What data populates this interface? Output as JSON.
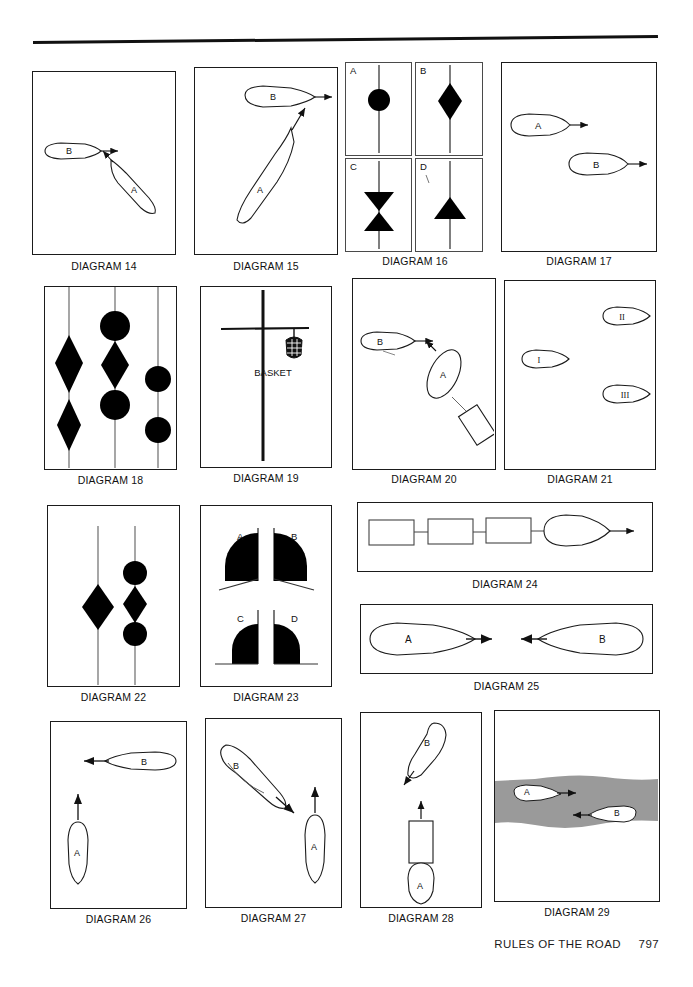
{
  "page": {
    "footer_title": "RULES OF THE ROAD",
    "footer_page_number": "797",
    "ink_color": "#1b1b1b",
    "shape_fill": "#000000",
    "channel_fill": "#9a9a9a"
  },
  "diagrams": [
    {
      "id": 14,
      "label": "DIAGRAM 14",
      "description": "Two power-driven vessels crossing: vessel B heading right, vessel A heading up-left",
      "vessels": [
        {
          "name": "B",
          "heading": "right"
        },
        {
          "name": "A",
          "heading": "up-left"
        }
      ]
    },
    {
      "id": 15,
      "label": "DIAGRAM 15",
      "description": "Vessel B heading right near top, vessel A heading up-right crossing below",
      "vessels": [
        {
          "name": "B",
          "heading": "right"
        },
        {
          "name": "A",
          "heading": "up-right"
        }
      ]
    },
    {
      "id": 16,
      "label": "DIAGRAM 16",
      "description": "Four day-shape panels on a mast",
      "panels": [
        {
          "name": "A",
          "shape": "ball"
        },
        {
          "name": "B",
          "shape": "diamond"
        },
        {
          "name": "C",
          "shape": "two-cones-points-together"
        },
        {
          "name": "D",
          "shape": "cone-point-up"
        }
      ]
    },
    {
      "id": 17,
      "label": "DIAGRAM 17",
      "description": "Vessel A above and vessel B below, both heading right",
      "vessels": [
        {
          "name": "A",
          "heading": "right"
        },
        {
          "name": "B",
          "heading": "right"
        }
      ]
    },
    {
      "id": 18,
      "label": "DIAGRAM 18",
      "description": "Three masts carrying day shapes: diamonds and balls",
      "masts": [
        {
          "shapes": [
            "diamond",
            "diamond"
          ]
        },
        {
          "shapes": [
            "ball",
            "diamond",
            "ball"
          ]
        },
        {
          "shapes": [
            "ball",
            "ball"
          ]
        }
      ]
    },
    {
      "id": 19,
      "label": "DIAGRAM 19",
      "description": "Mast with yardarm and a basket day shape hanging from it",
      "annotation": "BASKET"
    },
    {
      "id": 20,
      "label": "DIAGRAM 20",
      "description": "Vessel B heading right, vessel A towing astern heading up-left toward B",
      "vessels": [
        {
          "name": "B",
          "heading": "right"
        },
        {
          "name": "A",
          "heading": "up-left",
          "tow": "barge astern"
        }
      ]
    },
    {
      "id": 21,
      "label": "DIAGRAM 21",
      "description": "Three vessels numbered I, II, III",
      "vessels": [
        {
          "name": "I",
          "heading": "right"
        },
        {
          "name": "II",
          "heading": "left"
        },
        {
          "name": "III",
          "heading": "left"
        }
      ]
    },
    {
      "id": 22,
      "label": "DIAGRAM 22",
      "description": "Two masts: one with a diamond, one with ball-diamond-ball",
      "masts": [
        {
          "shapes": [
            "diamond"
          ]
        },
        {
          "shapes": [
            "ball",
            "diamond",
            "ball"
          ]
        }
      ]
    },
    {
      "id": 23,
      "label": "DIAGRAM 23",
      "description": "Four panels showing cone day-shape orientations",
      "panels": [
        {
          "name": "A",
          "shape": "half-disc-left-upper"
        },
        {
          "name": "B",
          "shape": "half-disc-right-upper"
        },
        {
          "name": "C",
          "shape": "quarter-disc-left-lower"
        },
        {
          "name": "D",
          "shape": "quarter-disc-right-lower"
        }
      ]
    },
    {
      "id": 24,
      "label": "DIAGRAM 24",
      "description": "Tug with three barges in tow astern, heading right",
      "units": [
        "barge",
        "barge",
        "barge",
        "tug"
      ]
    },
    {
      "id": 25,
      "label": "DIAGRAM 25",
      "description": "Vessel A and vessel B meeting head on",
      "vessels": [
        {
          "name": "A",
          "heading": "right"
        },
        {
          "name": "B",
          "heading": "left"
        }
      ]
    },
    {
      "id": 26,
      "label": "DIAGRAM 26",
      "description": "Vessel B heading left across the bow of vessel A heading up",
      "vessels": [
        {
          "name": "B",
          "heading": "left"
        },
        {
          "name": "A",
          "heading": "up"
        }
      ]
    },
    {
      "id": 27,
      "label": "DIAGRAM 27",
      "description": "Vessel B heading down-right, vessel A heading up",
      "vessels": [
        {
          "name": "B",
          "heading": "down-right"
        },
        {
          "name": "A",
          "heading": "up"
        }
      ]
    },
    {
      "id": 28,
      "label": "DIAGRAM 28",
      "description": "Vessel B heading down-left, vessel A pushing a barge ahead heading up",
      "vessels": [
        {
          "name": "B",
          "heading": "down-left"
        },
        {
          "name": "A",
          "heading": "up",
          "tow": "barge pushed ahead"
        }
      ]
    },
    {
      "id": 29,
      "label": "DIAGRAM 29",
      "description": "Narrow channel shown in grey with vessel A heading right and vessel B heading left",
      "vessels": [
        {
          "name": "A",
          "heading": "right"
        },
        {
          "name": "B",
          "heading": "left"
        }
      ]
    }
  ]
}
